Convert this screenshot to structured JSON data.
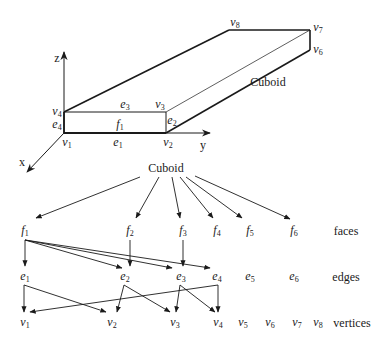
{
  "cuboid_figure": {
    "axes": {
      "x": "x",
      "y": "y",
      "z": "z"
    },
    "label": "Cuboid",
    "vertices": [
      {
        "name": "v",
        "sub": "1"
      },
      {
        "name": "v",
        "sub": "2"
      },
      {
        "name": "v",
        "sub": "3"
      },
      {
        "name": "v",
        "sub": "4"
      },
      {
        "name": "v",
        "sub": "6"
      },
      {
        "name": "v",
        "sub": "7"
      },
      {
        "name": "v",
        "sub": "8"
      }
    ],
    "edges": [
      {
        "name": "e",
        "sub": "1"
      },
      {
        "name": "e",
        "sub": "2"
      },
      {
        "name": "e",
        "sub": "3"
      },
      {
        "name": "e",
        "sub": "4"
      }
    ],
    "faces": [
      {
        "name": "f",
        "sub": "1"
      }
    ]
  },
  "tree": {
    "root": "Cuboid",
    "row_labels": {
      "faces": "faces",
      "edges": "edges",
      "vertices": "vertices"
    },
    "faces": [
      {
        "name": "f",
        "sub": "1"
      },
      {
        "name": "f",
        "sub": "2"
      },
      {
        "name": "f",
        "sub": "3"
      },
      {
        "name": "f",
        "sub": "4"
      },
      {
        "name": "f",
        "sub": "5"
      },
      {
        "name": "f",
        "sub": "6"
      }
    ],
    "edges": [
      {
        "name": "e",
        "sub": "1"
      },
      {
        "name": "e",
        "sub": "2"
      },
      {
        "name": "e",
        "sub": "3"
      },
      {
        "name": "e",
        "sub": "4"
      },
      {
        "name": "e",
        "sub": "5"
      },
      {
        "name": "e",
        "sub": "6"
      }
    ],
    "vertices": [
      {
        "name": "v",
        "sub": "1"
      },
      {
        "name": "v",
        "sub": "2"
      },
      {
        "name": "v",
        "sub": "3"
      },
      {
        "name": "v",
        "sub": "4"
      },
      {
        "name": "v",
        "sub": "5"
      },
      {
        "name": "v",
        "sub": "6"
      },
      {
        "name": "v",
        "sub": "7"
      },
      {
        "name": "v",
        "sub": "8"
      }
    ],
    "links": {
      "root_to_faces": [
        "f1",
        "f2",
        "f3",
        "f4",
        "f5",
        "f6"
      ],
      "f1_to_edges": [
        "e1",
        "e2",
        "e3",
        "e4"
      ],
      "f2_to_edges": [
        "e2"
      ],
      "f3_to_edges": [
        "e3"
      ],
      "e1_to_vertices": [
        "v1",
        "v2"
      ],
      "e2_to_vertices": [
        "v2",
        "v3"
      ],
      "e3_to_vertices": [
        "v3",
        "v4"
      ],
      "e4_to_vertices": [
        "v4",
        "v1"
      ]
    }
  }
}
